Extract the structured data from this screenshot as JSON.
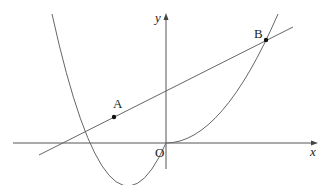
{
  "diagram": {
    "type": "coordinate-graph",
    "axes": {
      "x_label": "x",
      "y_label": "y",
      "origin_label": "O"
    },
    "curves": [
      {
        "name": "parabola",
        "kind": "y = a x^2 (upward, vertex at O)"
      },
      {
        "name": "line",
        "kind": "straight line with positive slope, positive y-intercept"
      }
    ],
    "points": [
      {
        "label": "A",
        "position": "left intersection of line and parabola"
      },
      {
        "label": "B",
        "position": "right intersection of line and parabola"
      }
    ],
    "colors": {
      "stroke": "#555555",
      "point": "#111111",
      "background": "#ffffff"
    }
  }
}
